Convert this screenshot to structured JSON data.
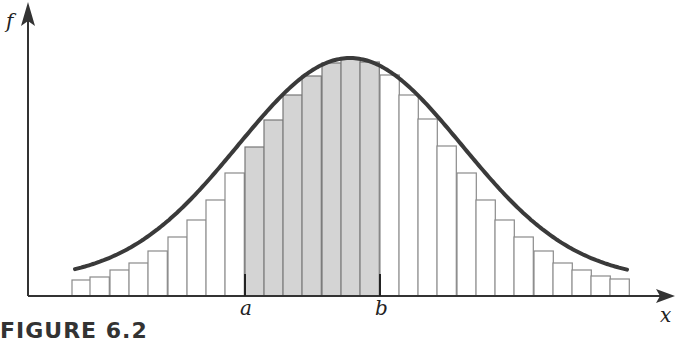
{
  "figure": {
    "caption": "FIGURE 6.2",
    "y_axis_label": "f",
    "x_axis_label": "x",
    "interval_start_label": "a",
    "interval_end_label": "b"
  },
  "colors": {
    "curve": "#3a3a3a",
    "axis": "#333333",
    "bar_edge": "#8a8a8a",
    "shaded_fill": "#d4d4d4",
    "unshaded_fill": "#ffffff"
  },
  "chart_data": {
    "type": "bar",
    "title": "",
    "xlabel": "x",
    "ylabel": "f",
    "baseline_px": 296,
    "bar_left_edges_px": [
      72,
      90,
      110,
      129,
      148,
      168,
      187,
      206,
      225,
      245,
      264,
      283,
      302,
      322,
      341,
      360,
      380,
      399,
      418,
      437,
      457,
      476,
      495,
      514,
      534,
      553,
      572,
      591,
      610
    ],
    "bar_width_px": 19.3,
    "values": [
      16,
      19,
      26,
      33,
      45,
      59,
      76,
      96,
      123,
      149,
      176,
      201,
      220,
      233,
      238,
      234,
      221,
      201,
      177,
      150,
      123,
      96,
      76,
      59,
      45,
      33,
      26,
      20,
      17
    ],
    "shaded_range": {
      "start_label": "a",
      "end_label": "b",
      "start_bar_index": 9,
      "end_bar_index": 15
    },
    "curve": {
      "type": "normal",
      "peak_x_px": 350,
      "peak_y_px": 58
    },
    "grid": false,
    "legend": null
  }
}
